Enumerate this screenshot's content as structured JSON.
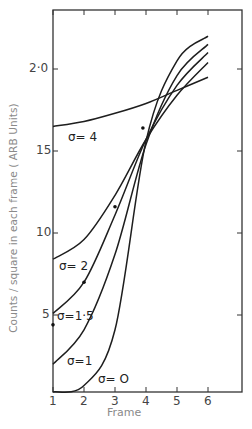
{
  "chart_data": {
    "type": "line",
    "title": "",
    "xlabel": "Frame",
    "ylabel": "Counts / square in each frame ( ARB Units)",
    "x": [
      1,
      2,
      3,
      4,
      5,
      6
    ],
    "x_tick_labels": [
      "1",
      "2",
      "3",
      "4",
      "5",
      "6"
    ],
    "y_ticks": [
      5,
      10,
      15,
      20
    ],
    "y_tick_labels": [
      "5",
      "10",
      "15",
      "2·0"
    ],
    "xlim": [
      1,
      7.1
    ],
    "ylim": [
      0,
      23.5
    ],
    "grid": false,
    "legend": "inline curve labels",
    "series": [
      {
        "name": "σ = 0",
        "label": "σ= O",
        "values": [
          0.3,
          0.7,
          4.1,
          15.6,
          20.5,
          22.0
        ]
      },
      {
        "name": "σ = 1",
        "label": "σ=1",
        "values": [
          2.0,
          4.1,
          8.7,
          15.4,
          19.6,
          21.5
        ]
      },
      {
        "name": "σ = 1.5",
        "label": "σ=1·5",
        "values": [
          5.1,
          7.0,
          11.1,
          15.7,
          19.0,
          21.0
        ]
      },
      {
        "name": "σ = 2",
        "label": "σ= 2",
        "values": [
          8.4,
          9.6,
          12.3,
          15.7,
          18.4,
          20.4
        ]
      },
      {
        "name": "σ = 4",
        "label": "σ= 4",
        "values": [
          16.5,
          16.8,
          17.3,
          17.9,
          18.7,
          19.5
        ]
      }
    ],
    "data_points": [
      {
        "x": 1.0,
        "y": 4.4
      },
      {
        "x": 2.0,
        "y": 7.0
      },
      {
        "x": 3.0,
        "y": 11.6
      },
      {
        "x": 3.9,
        "y": 16.4
      }
    ]
  },
  "labels": {
    "xlabel": "Frame",
    "ylabel": "Counts / square in each frame ( ARB Units)",
    "curve_labels": [
      "σ= 4",
      "σ= 2",
      "σ=1·5",
      "σ=1",
      "σ= O"
    ]
  }
}
